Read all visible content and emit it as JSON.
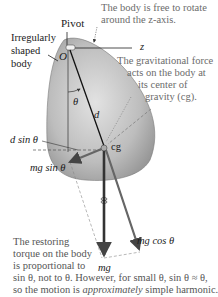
{
  "labels": {
    "pivot": "Pivot",
    "body_line1": "Irregularly",
    "body_line2": "shaped",
    "body_line3": "body",
    "origin": "O",
    "z_axis": "z",
    "theta": "θ",
    "d": "d",
    "d_sin_theta": "d sin θ",
    "cg": "cg",
    "mg_sin_theta": "mg sin θ",
    "mg_cos_theta": "mg cos θ",
    "mg": "mg"
  },
  "notes": {
    "rotate_line1": "The body is free to rotate",
    "rotate_line2": "around the z-axis.",
    "gravity_line1": "The gravitational force",
    "gravity_line2": "acts on the body at",
    "gravity_line3": "its center of",
    "gravity_line4": "gravity (cg).",
    "torque_line1": "The restoring",
    "torque_line2": "torque on the body",
    "torque_line3": "is proportional to",
    "torque_line4": "sin θ, not to θ. However, for small θ, sin θ ≈ θ,",
    "torque_line5a": "so the motion is ",
    "torque_line5b": "approximately",
    "torque_line5c": " simple harmonic."
  },
  "colors": {
    "body_light": "#d9d9d9",
    "body_dark": "#8a8a8a",
    "arrow": "#555555",
    "text_note": "#6b6b6b"
  }
}
